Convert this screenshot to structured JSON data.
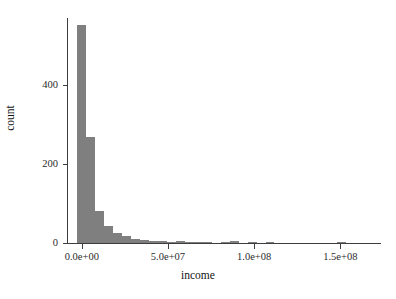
{
  "chart_data": {
    "type": "bar",
    "subtype": "histogram",
    "title": "",
    "xlabel": "income",
    "ylabel": "count",
    "xlim": [
      -8000000,
      173000000
    ],
    "ylim": [
      0,
      570
    ],
    "grid": false,
    "legend": null,
    "bar_color": "#7f7f7f",
    "axis_color": "#3d3d3d",
    "background": "#ffffff",
    "xticks": [
      {
        "value": 0,
        "label": "0.0e+00"
      },
      {
        "value": 50000000,
        "label": "5.0e+07"
      },
      {
        "value": 100000000,
        "label": "1.0e+08"
      },
      {
        "value": 150000000,
        "label": "1.5e+08"
      }
    ],
    "yticks": [
      {
        "value": 0,
        "label": "0"
      },
      {
        "value": 200,
        "label": "200"
      },
      {
        "value": 400,
        "label": "400"
      }
    ],
    "binwidth": 5200000,
    "bins": [
      {
        "x0": -2600000,
        "x1": 2600000,
        "count": 552
      },
      {
        "x0": 2600000,
        "x1": 7800000,
        "count": 268
      },
      {
        "x0": 7800000,
        "x1": 13000000,
        "count": 80
      },
      {
        "x0": 13000000,
        "x1": 18200000,
        "count": 44
      },
      {
        "x0": 18200000,
        "x1": 23400000,
        "count": 26
      },
      {
        "x0": 23400000,
        "x1": 28600000,
        "count": 17
      },
      {
        "x0": 28600000,
        "x1": 33800000,
        "count": 11
      },
      {
        "x0": 33800000,
        "x1": 39000000,
        "count": 8
      },
      {
        "x0": 39000000,
        "x1": 44200000,
        "count": 5
      },
      {
        "x0": 44200000,
        "x1": 49400000,
        "count": 4
      },
      {
        "x0": 49400000,
        "x1": 54600000,
        "count": 3
      },
      {
        "x0": 54600000,
        "x1": 59800000,
        "count": 4
      },
      {
        "x0": 59800000,
        "x1": 65000000,
        "count": 3
      },
      {
        "x0": 65000000,
        "x1": 70200000,
        "count": 3
      },
      {
        "x0": 70200000,
        "x1": 75400000,
        "count": 2
      },
      {
        "x0": 75400000,
        "x1": 80600000,
        "count": 0
      },
      {
        "x0": 80600000,
        "x1": 85800000,
        "count": 3
      },
      {
        "x0": 85800000,
        "x1": 91000000,
        "count": 4
      },
      {
        "x0": 91000000,
        "x1": 96200000,
        "count": 0
      },
      {
        "x0": 96200000,
        "x1": 101400000,
        "count": 2
      },
      {
        "x0": 101400000,
        "x1": 106600000,
        "count": 0
      },
      {
        "x0": 106600000,
        "x1": 111800000,
        "count": 2
      },
      {
        "x0": 111800000,
        "x1": 117000000,
        "count": 0
      },
      {
        "x0": 117000000,
        "x1": 122200000,
        "count": 0
      },
      {
        "x0": 122200000,
        "x1": 127400000,
        "count": 0
      },
      {
        "x0": 127400000,
        "x1": 132600000,
        "count": 0
      },
      {
        "x0": 132600000,
        "x1": 137800000,
        "count": 0
      },
      {
        "x0": 137800000,
        "x1": 143000000,
        "count": 0
      },
      {
        "x0": 143000000,
        "x1": 148200000,
        "count": 0
      },
      {
        "x0": 148200000,
        "x1": 153400000,
        "count": 2
      },
      {
        "x0": 153400000,
        "x1": 158600000,
        "count": 0
      },
      {
        "x0": 158600000,
        "x1": 163800000,
        "count": 0
      }
    ]
  }
}
